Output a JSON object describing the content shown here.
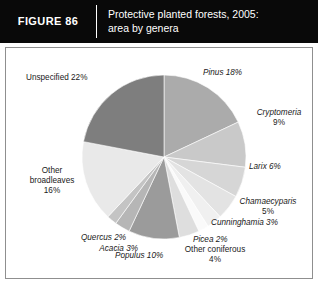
{
  "header": {
    "figure_number": "FIGURE 86",
    "title_line1": "Protective planted forests, 2005:",
    "title_line2": "area by genera"
  },
  "chart_data": {
    "type": "pie",
    "title": "Protective planted forests, 2005: area by genera",
    "unit": "percent of area",
    "legend": "none (direct labels)",
    "start_angle_deg": 0,
    "direction": "clockwise",
    "categories": [
      "Pinus",
      "Cryptomeria",
      "Larix",
      "Chamaecyparis",
      "Cunninghamia",
      "Picea",
      "Other coniferous",
      "Populus",
      "Acacia",
      "Quercus",
      "Other broadleaves",
      "Unspecified"
    ],
    "values": [
      18,
      9,
      6,
      5,
      3,
      2,
      4,
      10,
      3,
      2,
      16,
      22
    ],
    "colors": [
      "#ababab",
      "#c9c9c9",
      "#d6d6d6",
      "#e3e3e3",
      "#f0f0f0",
      "#fafafa",
      "#dedede",
      "#9b9b9b",
      "#b6b6b6",
      "#c4c4c4",
      "#e9e9e9",
      "#7e7e7e"
    ],
    "slice_labels": [
      "Pinus 18%",
      "Cryptomeria 9%",
      "Larix 6%",
      "Chamaecyparis 5%",
      "Cunninghamia 3%",
      "Picea 2%",
      "Other coniferous 4%",
      "Populus 10%",
      "Acacia 3%",
      "Quercus 2%",
      "Other broadleaves 16%",
      "Unspecified 22%"
    ]
  },
  "labels": {
    "unspecified": "Unspecified 22%",
    "pinus": "Pinus 18%",
    "cryptomeria_name": "Cryptomeria",
    "cryptomeria_value": "9%",
    "larix": "Larix 6%",
    "chamaecyparis_name": "Chamaecyparis",
    "chamaecyparis_value": "5%",
    "cunninghamia": "Cunninghamia 3%",
    "picea": "Picea 2%",
    "other_coniferous_name": "Other coniferous",
    "other_coniferous_value": "4%",
    "populus": "Populus 10%",
    "acacia": "Acacia 3%",
    "quercus": "Quercus 2%",
    "other_broadleaves_l1": "Other",
    "other_broadleaves_l2": "broadleaves",
    "other_broadleaves_l3": "16%"
  }
}
